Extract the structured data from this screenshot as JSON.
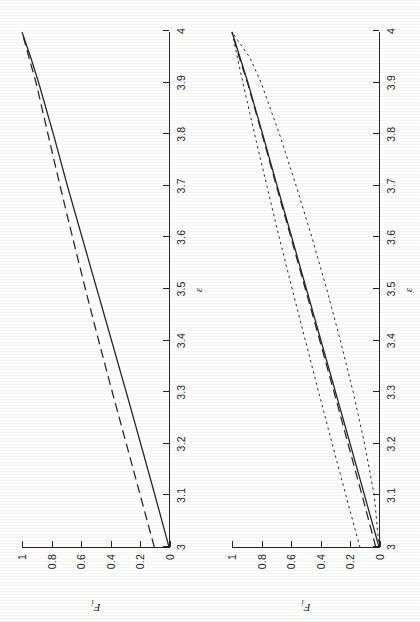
{
  "figure": {
    "background_color": "#fefefe",
    "ink_color": "#262626",
    "panel_count": 2,
    "orientation_note": "rotated"
  },
  "panels": [
    {
      "id": "left",
      "axis": {
        "x_label": "ε",
        "y_label_base": "F",
        "y_label_sub": "i",
        "x_ticks": [
          "3",
          "3.1",
          "3.2",
          "3.3",
          "3.4",
          "3.5",
          "3.6",
          "3.7",
          "3.8",
          "3.9",
          "4"
        ],
        "y_ticks": [
          "0",
          "0.2",
          "0.4",
          "0.6",
          "0.8",
          "1"
        ],
        "xlim": [
          3,
          4
        ],
        "ylim": [
          0,
          1
        ]
      }
    },
    {
      "id": "right",
      "axis": {
        "x_label": "ε",
        "y_label_base": "F",
        "y_label_sub": "i",
        "x_ticks": [
          "3",
          "3.1",
          "3.2",
          "3.3",
          "3.4",
          "3.5",
          "3.6",
          "3.7",
          "3.8",
          "3.9",
          "4"
        ],
        "y_ticks": [
          "0",
          "0.2",
          "0.4",
          "0.6",
          "0.8",
          "1"
        ],
        "xlim": [
          3,
          4
        ],
        "ylim": [
          0,
          1
        ]
      }
    }
  ],
  "chart_data": [
    {
      "type": "line",
      "panel": "left",
      "title": "",
      "xlabel": "ε",
      "ylabel": "F_i",
      "xlim": [
        3,
        4
      ],
      "ylim": [
        0,
        1
      ],
      "grid": false,
      "legend": "none",
      "x": [
        3.0,
        3.1,
        3.2,
        3.3,
        3.4,
        3.5,
        3.6,
        3.7,
        3.8,
        3.9,
        3.95,
        4.0
      ],
      "series": [
        {
          "name": "solid",
          "style": "solid",
          "values": [
            0.0,
            0.095,
            0.192,
            0.29,
            0.39,
            0.49,
            0.59,
            0.69,
            0.785,
            0.885,
            0.94,
            1.0
          ]
        },
        {
          "name": "dashed",
          "style": "dashed",
          "values": [
            0.1,
            0.195,
            0.29,
            0.385,
            0.478,
            0.568,
            0.655,
            0.74,
            0.822,
            0.903,
            0.952,
            1.0
          ]
        }
      ]
    },
    {
      "type": "line",
      "panel": "right",
      "title": "",
      "xlabel": "ε",
      "ylabel": "F_i",
      "xlim": [
        3,
        4
      ],
      "ylim": [
        0,
        1
      ],
      "grid": false,
      "legend": "none",
      "x": [
        3.0,
        3.1,
        3.2,
        3.3,
        3.4,
        3.5,
        3.6,
        3.7,
        3.8,
        3.9,
        3.95,
        4.0
      ],
      "series": [
        {
          "name": "solid",
          "style": "solid",
          "values": [
            0.0,
            0.098,
            0.196,
            0.295,
            0.394,
            0.493,
            0.592,
            0.692,
            0.79,
            0.89,
            0.945,
            1.0
          ]
        },
        {
          "name": "dashed",
          "style": "dashed",
          "values": [
            0.022,
            0.115,
            0.21,
            0.305,
            0.402,
            0.5,
            0.598,
            0.697,
            0.794,
            0.893,
            0.95,
            1.0
          ]
        },
        {
          "name": "dotted-upper",
          "style": "dotted",
          "values": [
            0.13,
            0.225,
            0.318,
            0.41,
            0.5,
            0.59,
            0.678,
            0.762,
            0.845,
            0.925,
            0.963,
            1.0
          ]
        },
        {
          "name": "dotted-lower",
          "style": "dotted",
          "values": [
            0.0,
            0.032,
            0.098,
            0.175,
            0.262,
            0.355,
            0.455,
            0.562,
            0.675,
            0.8,
            0.878,
            1.0
          ]
        }
      ]
    }
  ]
}
